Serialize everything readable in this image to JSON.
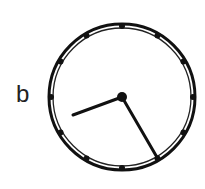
{
  "figure": {
    "label": "b",
    "clock": {
      "time_shown": "8:23",
      "hour_marks": 12,
      "colors": {
        "ink": "#111111",
        "background": "#ffffff"
      }
    }
  }
}
